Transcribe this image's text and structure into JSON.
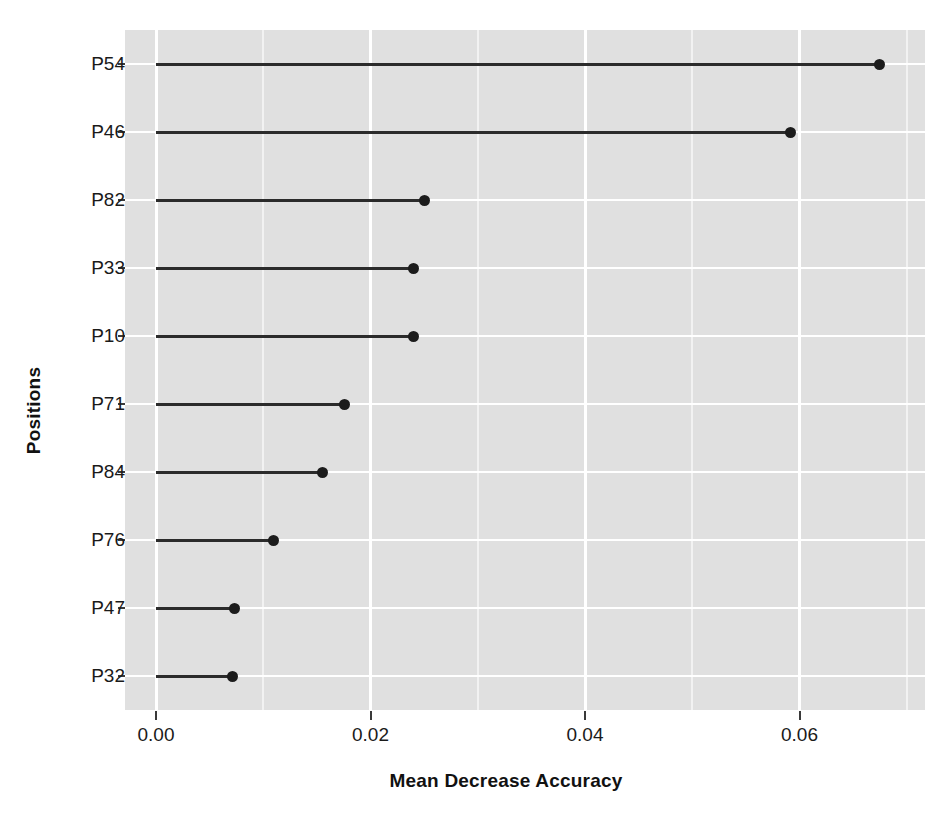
{
  "chart_data": {
    "type": "bar",
    "subtype": "lollipop-horizontal",
    "title": "",
    "xlabel": "Mean Decrease Accuracy",
    "ylabel": "Positions",
    "categories": [
      "P54",
      "P46",
      "P82",
      "P33",
      "P10",
      "P71",
      "P84",
      "P76",
      "P47",
      "P32"
    ],
    "values": [
      0.0675,
      0.0592,
      0.025,
      0.024,
      0.024,
      0.0176,
      0.0155,
      0.011,
      0.0073,
      0.0071
    ],
    "xlim": [
      -0.0025,
      0.0728
    ],
    "ylim_categories": 10,
    "xticks": [
      0.0,
      0.02,
      0.04,
      0.06
    ],
    "xtick_labels": [
      "0.00",
      "0.02",
      "0.04",
      "0.06"
    ],
    "grid": "vertical-major-and-minor, horizontal-at-categories",
    "legend": "none",
    "panel_background": "#e0e0e0",
    "grid_color": "#ffffff",
    "point_color": "#1c1c1c",
    "line_color": "#2b2b2b"
  },
  "axes": {
    "x_title": "Mean Decrease Accuracy",
    "y_title": "Positions",
    "x_tick_labels": [
      "0.00",
      "0.02",
      "0.04",
      "0.06"
    ],
    "y_tick_labels": [
      "P54",
      "P46",
      "P82",
      "P33",
      "P10",
      "P71",
      "P84",
      "P76",
      "P47",
      "P32"
    ]
  }
}
